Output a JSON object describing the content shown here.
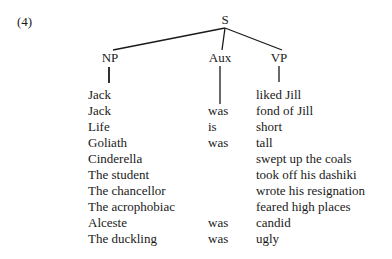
{
  "example_number": "(4)",
  "tree": {
    "root": "S",
    "children": [
      "NP",
      "Aux",
      "VP"
    ]
  },
  "rows": [
    {
      "np": "Jack",
      "aux": "",
      "vp": "liked Jill"
    },
    {
      "np": "Jack",
      "aux": "was",
      "vp": "fond of Jill"
    },
    {
      "np": "Life",
      "aux": "is",
      "vp": "short"
    },
    {
      "np": "Goliath",
      "aux": "was",
      "vp": "tall"
    },
    {
      "np": "Cinderella",
      "aux": "",
      "vp": "swept up the coals"
    },
    {
      "np": "The student",
      "aux": "",
      "vp": "took off his dashiki"
    },
    {
      "np": "The chancellor",
      "aux": "",
      "vp": "wrote his resignation"
    },
    {
      "np": "The acrophobiac",
      "aux": "",
      "vp": "feared high places"
    },
    {
      "np": "Alceste",
      "aux": "was",
      "vp": "candid"
    },
    {
      "np": "The duckling",
      "aux": "was",
      "vp": "ugly"
    }
  ]
}
